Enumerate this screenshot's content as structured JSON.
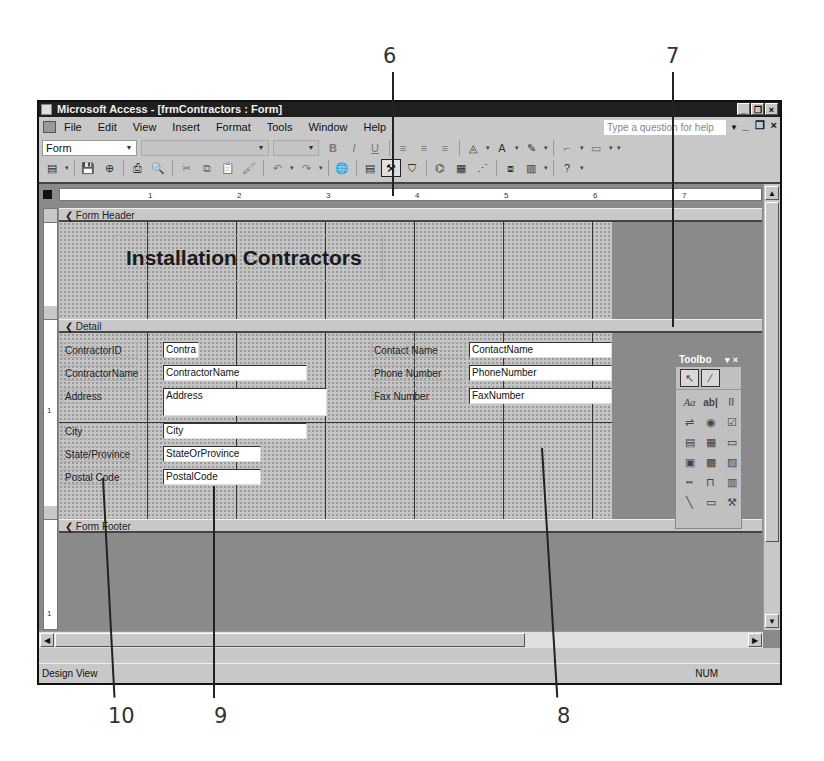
{
  "callouts": {
    "top": [
      {
        "label": "6"
      },
      {
        "label": "7"
      }
    ],
    "bottom": [
      {
        "label": "10"
      },
      {
        "label": "9"
      },
      {
        "label": "8"
      }
    ]
  },
  "window": {
    "title": "Microsoft Access - [frmContractors : Form]",
    "controls": {
      "minimize": "_",
      "restore": "❐",
      "close": "×"
    }
  },
  "menubar": {
    "items": [
      {
        "label": "File"
      },
      {
        "label": "Edit"
      },
      {
        "label": "View"
      },
      {
        "label": "Insert"
      },
      {
        "label": "Format"
      },
      {
        "label": "Tools"
      },
      {
        "label": "Window"
      },
      {
        "label": "Help"
      }
    ],
    "help_placeholder": "Type a question for help",
    "doc_controls": {
      "minimize": "_",
      "restore": "❐",
      "close": "×"
    }
  },
  "format_toolbar": {
    "object_combo": "Form",
    "font_combo": "",
    "size_combo": "",
    "buttons": [
      {
        "name": "bold",
        "glyph": "B"
      },
      {
        "name": "italic",
        "glyph": "I"
      },
      {
        "name": "underline",
        "glyph": "U"
      },
      {
        "name": "align-left",
        "glyph": "≡"
      },
      {
        "name": "align-center",
        "glyph": "≡"
      },
      {
        "name": "align-right",
        "glyph": "≡"
      },
      {
        "name": "fill-color",
        "glyph": "◬"
      },
      {
        "name": "font-color",
        "glyph": "A"
      },
      {
        "name": "line-color",
        "glyph": "✎"
      },
      {
        "name": "line-width",
        "glyph": "⌐"
      },
      {
        "name": "special-effect",
        "glyph": "▭"
      }
    ]
  },
  "standard_toolbar": {
    "buttons": [
      {
        "name": "view",
        "glyph": "▤"
      },
      {
        "name": "save",
        "glyph": "💾"
      },
      {
        "name": "search",
        "glyph": "⊕"
      },
      {
        "name": "print",
        "glyph": "⎙"
      },
      {
        "name": "print-preview",
        "glyph": "🔍"
      },
      {
        "name": "cut",
        "glyph": "✂"
      },
      {
        "name": "copy",
        "glyph": "⧉"
      },
      {
        "name": "paste",
        "glyph": "📋"
      },
      {
        "name": "format-painter",
        "glyph": "🖌"
      },
      {
        "name": "undo",
        "glyph": "↶"
      },
      {
        "name": "redo",
        "glyph": "↷"
      },
      {
        "name": "insert-hyperlink",
        "glyph": "🌐"
      },
      {
        "name": "field-list",
        "glyph": "▤"
      },
      {
        "name": "toolbox",
        "glyph": "⚒"
      },
      {
        "name": "autoformat",
        "glyph": "⛉"
      },
      {
        "name": "code",
        "glyph": "⌬"
      },
      {
        "name": "properties",
        "glyph": "▦"
      },
      {
        "name": "build",
        "glyph": "⋰"
      },
      {
        "name": "database-window",
        "glyph": "⧈"
      },
      {
        "name": "new-object",
        "glyph": "▥"
      },
      {
        "name": "help",
        "glyph": "?"
      }
    ]
  },
  "ruler": {
    "horizontal_ticks": [
      "1",
      "2",
      "3",
      "4",
      "5",
      "6",
      "7"
    ],
    "vertical_ticks": [
      "1",
      "1"
    ]
  },
  "sections": {
    "header": {
      "label": "Form Header",
      "title": "Installation Contractors"
    },
    "detail": {
      "label": "Detail",
      "left_fields": [
        {
          "label": "ContractorID",
          "control": "Contra"
        },
        {
          "label": "ContractorName",
          "control": "ContractorName"
        },
        {
          "label": "Address",
          "control": "Address"
        },
        {
          "label": "City",
          "control": "City"
        },
        {
          "label": "State/Province",
          "control": "StateOrProvince"
        },
        {
          "label": "Postal Code",
          "control": "PostalCode"
        }
      ],
      "right_fields": [
        {
          "label": "Contact Name",
          "control": "ContactName"
        },
        {
          "label": "Phone Number",
          "control": "PhoneNumber"
        },
        {
          "label": "Fax Number",
          "control": "FaxNumber"
        }
      ]
    },
    "footer": {
      "label": "Form Footer"
    }
  },
  "toolbox": {
    "title": "Toolbo",
    "controls": "▾ ×",
    "top_tools": [
      {
        "name": "select-objects",
        "glyph": "↖"
      },
      {
        "name": "control-wizards",
        "glyph": "⁄"
      }
    ],
    "tools": [
      {
        "name": "label",
        "glyph": "Aa"
      },
      {
        "name": "text-box",
        "glyph": "ab|"
      },
      {
        "name": "option-group",
        "glyph": "⌷"
      },
      {
        "name": "toggle-button",
        "glyph": "⇌"
      },
      {
        "name": "option-button",
        "glyph": "◉"
      },
      {
        "name": "check-box",
        "glyph": "☑"
      },
      {
        "name": "combo-box",
        "glyph": "▤"
      },
      {
        "name": "list-box",
        "glyph": "▦"
      },
      {
        "name": "command-button",
        "glyph": "▭"
      },
      {
        "name": "image",
        "glyph": "▣"
      },
      {
        "name": "unbound-object-frame",
        "glyph": "▩"
      },
      {
        "name": "bound-object-frame",
        "glyph": "▨"
      },
      {
        "name": "page-break",
        "glyph": "┅"
      },
      {
        "name": "tab-control",
        "glyph": "⊓"
      },
      {
        "name": "subform",
        "glyph": "▥"
      },
      {
        "name": "line",
        "glyph": "╲"
      },
      {
        "name": "rectangle",
        "glyph": "▭"
      },
      {
        "name": "more-controls",
        "glyph": "⚒"
      }
    ]
  },
  "statusbar": {
    "mode": "Design View",
    "indicator": "NUM"
  }
}
